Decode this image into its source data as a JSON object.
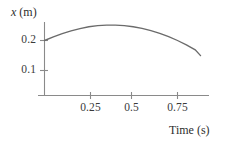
{
  "chart_data": {
    "type": "line",
    "title": "",
    "xlabel": "Time (s)",
    "ylabel": "x (m)",
    "ylabel_variable": "x",
    "ylabel_unit": "(m)",
    "xlabel_text": "Time (s)",
    "xlim": [
      0,
      0.95
    ],
    "ylim": [
      0,
      0.29
    ],
    "grid": false,
    "legend": null,
    "xticks": [
      0.25,
      0.5,
      0.75
    ],
    "xtick_labels": [
      "0.25",
      "0.5",
      "0.75"
    ],
    "yticks": [
      0.1,
      0.2
    ],
    "ytick_labels": [
      "0.1",
      "0.2"
    ],
    "series": [
      {
        "name": "position",
        "x": [
          0.0,
          0.05,
          0.1,
          0.15,
          0.2,
          0.25,
          0.3,
          0.35,
          0.4,
          0.45,
          0.5,
          0.55,
          0.6,
          0.65,
          0.7,
          0.75,
          0.8,
          0.85,
          0.88
        ],
        "y": [
          0.2,
          0.213,
          0.225,
          0.235,
          0.243,
          0.25,
          0.254,
          0.256,
          0.256,
          0.254,
          0.25,
          0.244,
          0.236,
          0.226,
          0.214,
          0.2,
          0.184,
          0.166,
          0.145
        ]
      }
    ],
    "curve_description": "downward-opening parabola starting at 0.2 m, peaking near 0.256 m at about 0.37 s, ending near 0.145 m at 0.88 s",
    "colors": {
      "curve": "#6b6b6b",
      "axis": "#8a8a8a",
      "text": "#3a3a3a",
      "background": "#ffffff"
    }
  }
}
